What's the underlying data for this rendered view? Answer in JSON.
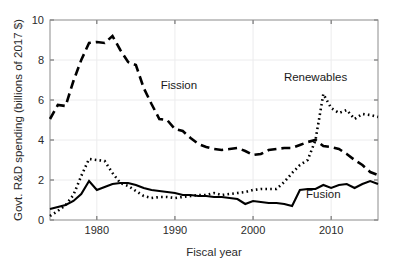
{
  "chart_data": {
    "type": "line",
    "title": "",
    "xlabel": "Fiscal year",
    "ylabel": "Govt. R&D spending (billions of 2017 $)",
    "xlim": [
      1974,
      2016
    ],
    "ylim": [
      0,
      10
    ],
    "xticks": [
      1980,
      1990,
      2000,
      2010
    ],
    "xticklabels": [
      "1980",
      "1990",
      "2000",
      "2010"
    ],
    "yticks": [
      0,
      2,
      4,
      6,
      8,
      10
    ],
    "yticklabels": [
      "0",
      "2",
      "4",
      "6",
      "8",
      "10"
    ],
    "grid": true,
    "legend_position": "inline-annotations",
    "x": [
      1974,
      1975,
      1976,
      1977,
      1978,
      1979,
      1980,
      1981,
      1982,
      1983,
      1984,
      1985,
      1986,
      1987,
      1988,
      1989,
      1990,
      1991,
      1992,
      1993,
      1994,
      1995,
      1996,
      1997,
      1998,
      1999,
      2000,
      2001,
      2002,
      2003,
      2004,
      2005,
      2006,
      2007,
      2008,
      2009,
      2010,
      2011,
      2012,
      2013,
      2014,
      2015,
      2016
    ],
    "series": [
      {
        "name": "Fission",
        "style": "dashed",
        "color": "#000000",
        "label_x": 1990.5,
        "label_y": 6.55,
        "values": [
          5.05,
          5.75,
          5.7,
          6.95,
          8.0,
          8.85,
          8.9,
          8.85,
          9.2,
          8.5,
          7.9,
          7.75,
          6.6,
          5.8,
          5.05,
          5.0,
          4.55,
          4.45,
          4.1,
          3.8,
          3.65,
          3.55,
          3.5,
          3.55,
          3.6,
          3.45,
          3.25,
          3.3,
          3.5,
          3.55,
          3.6,
          3.6,
          3.75,
          3.9,
          4.0,
          3.7,
          3.65,
          3.55,
          3.3,
          3.0,
          2.75,
          2.4,
          2.25
        ]
      },
      {
        "name": "Renewables",
        "style": "dotted",
        "color": "#000000",
        "label_x": 2008.0,
        "label_y": 6.95,
        "values": [
          0.2,
          0.45,
          0.75,
          1.25,
          2.2,
          3.05,
          3.0,
          2.95,
          2.35,
          1.85,
          1.7,
          1.45,
          1.2,
          1.1,
          1.15,
          1.15,
          1.1,
          1.15,
          1.2,
          1.25,
          1.25,
          1.35,
          1.25,
          1.3,
          1.35,
          1.4,
          1.5,
          1.55,
          1.55,
          1.55,
          1.9,
          2.35,
          2.75,
          3.0,
          4.0,
          6.3,
          5.6,
          5.35,
          5.5,
          5.05,
          5.3,
          5.25,
          5.15
        ]
      },
      {
        "name": "Fusion",
        "style": "solid",
        "color": "#000000",
        "label_x": 2009.0,
        "label_y": 1.1,
        "values": [
          0.55,
          0.65,
          0.75,
          0.95,
          1.3,
          1.95,
          1.5,
          1.65,
          1.8,
          1.85,
          1.85,
          1.75,
          1.6,
          1.5,
          1.45,
          1.4,
          1.35,
          1.25,
          1.25,
          1.2,
          1.2,
          1.15,
          1.15,
          1.1,
          1.05,
          0.8,
          0.95,
          0.9,
          0.85,
          0.85,
          0.8,
          0.7,
          1.5,
          1.55,
          1.55,
          1.75,
          1.6,
          1.75,
          1.8,
          1.6,
          1.8,
          1.95,
          1.8
        ]
      }
    ]
  }
}
